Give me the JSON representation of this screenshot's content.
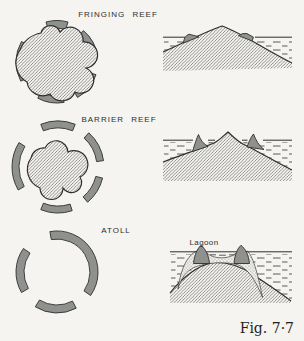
{
  "colors": {
    "paper": "#f5f4f0",
    "ink": "#2e2e2e",
    "reef": "#8f918f"
  },
  "labels": {
    "fringing": "FRINGING REEF",
    "barrier": "BARRIER REEF",
    "atoll": "ATOLL",
    "lagoon": "Lagoon",
    "figure_caption": "Fig. 7·7"
  }
}
